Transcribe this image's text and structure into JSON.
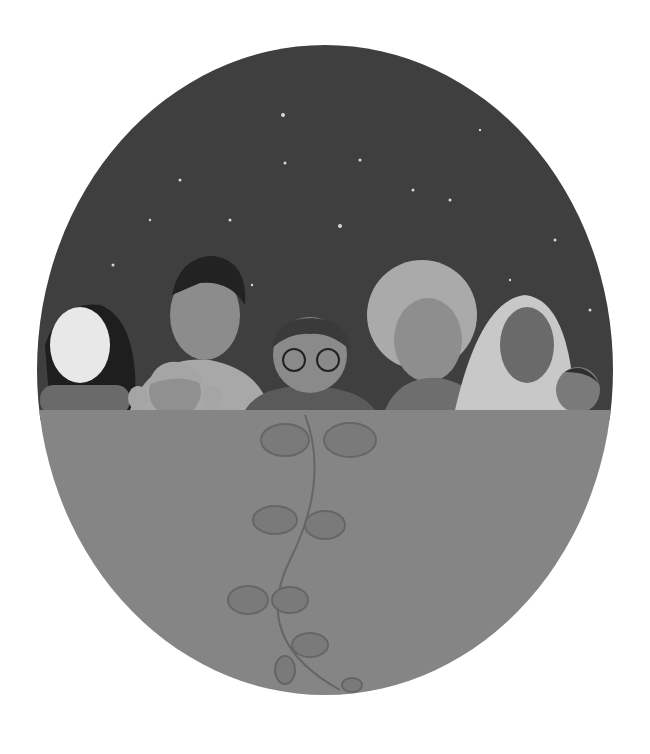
{
  "image": {
    "description": "Grayscale painted illustration of a diverse group of seven people peeking over a ledge inside a circular frame, night sky with stars above and a vine with leaves growing down the lower half",
    "colors": {
      "background": "#ffffff",
      "sky": "#3f3f3f",
      "ground": "#858585",
      "vine": "#6e6e6e",
      "star": "#d8d8d8"
    },
    "figures": [
      {
        "name": "woman-long-dark-hair",
        "skin": "#e8e8e8",
        "hair": "#1e1e1e"
      },
      {
        "name": "man-short-dark-hair",
        "skin": "#8c8c8c",
        "hair": "#222222"
      },
      {
        "name": "girl-pigtails",
        "skin": "#909090",
        "hair": "#a5a5a5"
      },
      {
        "name": "boy-curly-hair-glasses",
        "skin": "#8a8a8a",
        "hair": "#3a3a3a"
      },
      {
        "name": "person-afro-hair",
        "skin": "#8e8e8e",
        "hair": "#aaaaaa"
      },
      {
        "name": "woman-headscarf",
        "skin": "#6a6a6a",
        "scarf": "#c8c8c8"
      },
      {
        "name": "small-child",
        "skin": "#7a7a7a",
        "hair": "#2e2e2e"
      }
    ]
  }
}
